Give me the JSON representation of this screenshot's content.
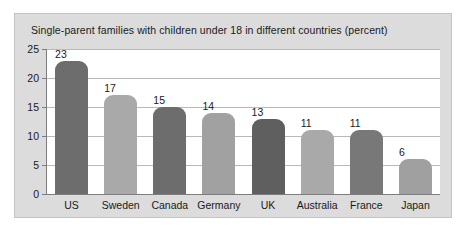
{
  "chart_data": {
    "type": "bar",
    "title": "Single-parent families with children under 18 in different countries (percent)",
    "xlabel": "",
    "ylabel": "",
    "ylim": [
      0,
      25
    ],
    "yticks": [
      0,
      5,
      10,
      15,
      20,
      25
    ],
    "grid": true,
    "legend": "none",
    "categories": [
      "US",
      "Sweden",
      "Canada",
      "Germany",
      "UK",
      "Australia",
      "France",
      "Japan"
    ],
    "values": [
      23,
      17,
      15,
      14,
      13,
      11,
      11,
      6
    ],
    "bar_colors": [
      "#6d6d6d",
      "#a9a9a9",
      "#6d6d6d",
      "#a1a1a1",
      "#5f5f5f",
      "#a9a9a9",
      "#787878",
      "#a0a0a0"
    ],
    "value_labels": [
      "23",
      "17",
      "15",
      "14",
      "13",
      "11",
      "11",
      "6"
    ],
    "ytick_labels": [
      "0",
      "5",
      "10",
      "15",
      "20",
      "25"
    ]
  },
  "colors": {
    "panel_background": "#dcdcdc",
    "plot_background": "#ffffff",
    "axis": "#7d7d7d",
    "gridline": "#b9b9b9",
    "text": "#1a1a1a"
  }
}
